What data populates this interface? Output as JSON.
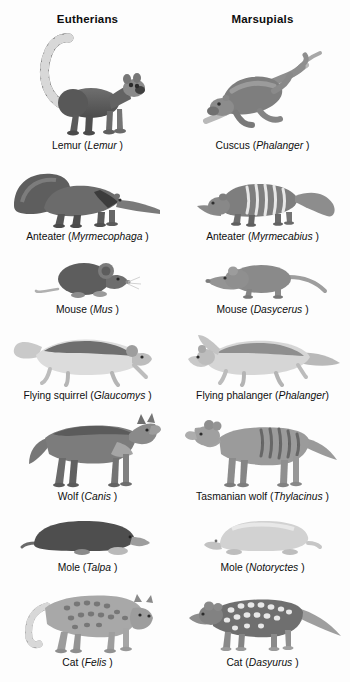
{
  "figure": {
    "columns": [
      {
        "label": "Eutherians"
      },
      {
        "label": "Marsupials"
      }
    ],
    "rows": [
      {
        "id": "lemur",
        "eutherian": {
          "common": "Lemur (",
          "genus": "Lemur",
          "close": " )",
          "icon": "lemur-illustration"
        },
        "marsupial": {
          "common": "Cuscus (",
          "genus": "Phalanger",
          "close": " )",
          "icon": "cuscus-illustration"
        }
      },
      {
        "id": "anteater",
        "eutherian": {
          "common": "Anteater (",
          "genus": "Myrmecophaga",
          "close": " )",
          "icon": "giant-anteater-illustration"
        },
        "marsupial": {
          "common": "Anteater (",
          "genus": "Myrmecabius",
          "close": " )",
          "icon": "numbat-illustration"
        }
      },
      {
        "id": "mouse",
        "eutherian": {
          "common": "Mouse (",
          "genus": "Mus",
          "close": " )",
          "icon": "mouse-illustration"
        },
        "marsupial": {
          "common": "Mouse (",
          "genus": "Dasycerus",
          "close": " )",
          "icon": "marsupial-mouse-illustration"
        }
      },
      {
        "id": "glider",
        "eutherian": {
          "common": "Flying squirrel (",
          "genus": "Glaucomys",
          "close": " )",
          "icon": "flying-squirrel-illustration"
        },
        "marsupial": {
          "common": "Flying phalanger (",
          "genus": "Phalanger",
          "close": ")",
          "icon": "flying-phalanger-illustration"
        }
      },
      {
        "id": "wolf",
        "eutherian": {
          "common": "Wolf (",
          "genus": "Canis",
          "close": " )",
          "icon": "wolf-illustration"
        },
        "marsupial": {
          "common": "Tasmanian wolf (",
          "genus": "Thylacinus",
          "close": " )",
          "icon": "thylacine-illustration"
        }
      },
      {
        "id": "mole",
        "eutherian": {
          "common": "Mole (",
          "genus": "Talpa",
          "close": " )",
          "icon": "mole-illustration"
        },
        "marsupial": {
          "common": "Mole (",
          "genus": "Notoryctes",
          "close": " )",
          "icon": "marsupial-mole-illustration"
        }
      },
      {
        "id": "cat",
        "eutherian": {
          "common": "Cat (",
          "genus": "Felis",
          "close": " )",
          "icon": "ocelot-illustration"
        },
        "marsupial": {
          "common": "Cat (",
          "genus": "Dasyurus",
          "close": " )",
          "icon": "quoll-illustration"
        }
      }
    ],
    "colors": {
      "background": "#fdfdfd",
      "text": "#0f0f0f",
      "ink_dark": "#4a4a4a",
      "ink_mid": "#7d7d7d",
      "ink_light": "#b4b4b4"
    }
  }
}
